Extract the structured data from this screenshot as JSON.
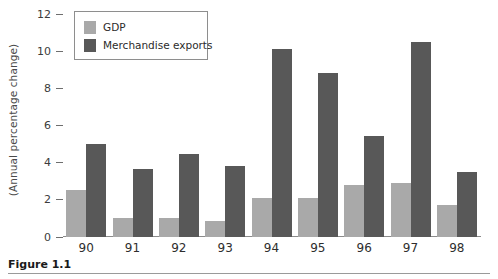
{
  "figure": {
    "caption": "Figure 1.1"
  },
  "chart_data": {
    "type": "bar",
    "title": "",
    "xlabel": "",
    "ylabel": "(Annual percentage change)",
    "categories": [
      "90",
      "91",
      "92",
      "93",
      "94",
      "95",
      "96",
      "97",
      "98"
    ],
    "series": [
      {
        "name": "GDP",
        "color": "#a9a9a9",
        "values": [
          2.55,
          1.0,
          1.0,
          0.85,
          2.1,
          2.1,
          2.8,
          2.9,
          1.7
        ]
      },
      {
        "name": "Merchandise exports",
        "color": "#585858",
        "values": [
          5.0,
          3.65,
          4.45,
          3.8,
          10.1,
          8.8,
          5.45,
          10.5,
          3.5
        ]
      }
    ],
    "ylim": [
      0,
      12
    ],
    "yticks": [
      0,
      2,
      4,
      6,
      8,
      10,
      12
    ],
    "grid": false,
    "legend_position": "top-left"
  }
}
